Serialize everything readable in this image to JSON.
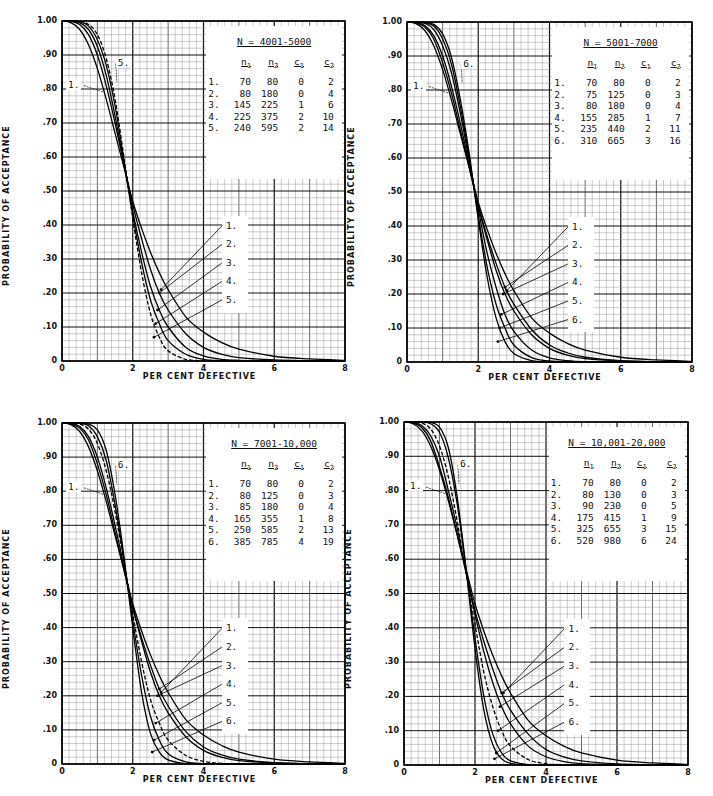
{
  "figure": {
    "xlabel": "PER CENT DEFECTIVE",
    "ylabel": "PROBABILITY OF ACCEPTANCE",
    "xticks": [
      "0",
      "2",
      "4",
      "6",
      "8"
    ],
    "yticks": [
      "1.00",
      ".90",
      ".80",
      ".70",
      ".60",
      ".50",
      ".40",
      ".30",
      ".20",
      ".10",
      "0"
    ]
  },
  "chart_data": [
    {
      "type": "line",
      "title": "N = 4001-5000",
      "xlabel": "PER CENT DEFECTIVE",
      "ylabel": "PROBABILITY OF ACCEPTANCE",
      "xlim": [
        0,
        8
      ],
      "ylim": [
        0,
        1.0
      ],
      "grid": true,
      "legend_position": "upper right (table)",
      "table_headers": [
        "n1",
        "n2",
        "c1",
        "c2"
      ],
      "plans": [
        {
          "id": "1.",
          "n1": "70",
          "n2": "80",
          "c1": "0",
          "c2": "2"
        },
        {
          "id": "2.",
          "n1": "80",
          "n2": "180",
          "c1": "0",
          "c2": "4"
        },
        {
          "id": "3.",
          "n1": "145",
          "n2": "225",
          "c1": "1",
          "c2": "6"
        },
        {
          "id": "4.",
          "n1": "225",
          "n2": "375",
          "c1": "2",
          "c2": "10"
        },
        {
          "id": "5.",
          "n1": "240",
          "n2": "595",
          "c1": "2",
          "c2": "14"
        }
      ],
      "x": [
        0,
        0.25,
        0.5,
        0.75,
        1.0,
        1.25,
        1.5,
        1.75,
        2.0,
        2.25,
        2.5,
        2.75,
        3.0,
        3.5,
        4.0,
        4.5,
        5.0,
        6.0,
        7.0,
        8.0
      ],
      "series": [
        {
          "name": "1.",
          "dashed": false,
          "values": [
            1.0,
            0.995,
            0.975,
            0.93,
            0.86,
            0.77,
            0.67,
            0.57,
            0.47,
            0.39,
            0.32,
            0.26,
            0.21,
            0.13,
            0.085,
            0.055,
            0.035,
            0.014,
            0.006,
            0.002
          ]
        },
        {
          "name": "2.",
          "dashed": false,
          "values": [
            1.0,
            0.999,
            0.99,
            0.96,
            0.9,
            0.81,
            0.7,
            0.58,
            0.46,
            0.36,
            0.27,
            0.2,
            0.15,
            0.08,
            0.04,
            0.02,
            0.01,
            0.003,
            0.001,
            0.0
          ]
        },
        {
          "name": "3.",
          "dashed": false,
          "values": [
            1.0,
            1.0,
            0.995,
            0.975,
            0.925,
            0.84,
            0.72,
            0.58,
            0.44,
            0.32,
            0.22,
            0.15,
            0.1,
            0.04,
            0.015,
            0.005,
            0.002,
            0.0,
            0.0,
            0.0
          ]
        },
        {
          "name": "4.",
          "dashed": false,
          "values": [
            1.0,
            1.0,
            0.998,
            0.985,
            0.945,
            0.87,
            0.75,
            0.59,
            0.43,
            0.29,
            0.18,
            0.11,
            0.06,
            0.02,
            0.005,
            0.001,
            0.0,
            0.0,
            0.0,
            0.0
          ]
        },
        {
          "name": "5.",
          "dashed": true,
          "values": [
            1.0,
            1.0,
            0.999,
            0.99,
            0.96,
            0.89,
            0.77,
            0.6,
            0.42,
            0.26,
            0.14,
            0.07,
            0.03,
            0.005,
            0.001,
            0.0,
            0.0,
            0.0,
            0.0,
            0.0
          ]
        }
      ],
      "curve_labels_top": [
        "1.",
        "5."
      ],
      "curve_labels_bottom": [
        "1.",
        "2.",
        "3.",
        "4.",
        "5."
      ]
    },
    {
      "type": "line",
      "title": "N = 5001-7000",
      "xlabel": "PER CENT DEFECTIVE",
      "ylabel": "PROBABILITY OF ACCEPTANCE",
      "xlim": [
        0,
        8
      ],
      "ylim": [
        0,
        1.0
      ],
      "grid": true,
      "legend_position": "upper right (table)",
      "table_headers": [
        "n1",
        "n2",
        "c1",
        "c2"
      ],
      "plans": [
        {
          "id": "1.",
          "n1": "70",
          "n2": "80",
          "c1": "0",
          "c2": "2"
        },
        {
          "id": "2.",
          "n1": "75",
          "n2": "125",
          "c1": "0",
          "c2": "3"
        },
        {
          "id": "3.",
          "n1": "80",
          "n2": "180",
          "c1": "0",
          "c2": "4"
        },
        {
          "id": "4.",
          "n1": "155",
          "n2": "285",
          "c1": "1",
          "c2": "7"
        },
        {
          "id": "5.",
          "n1": "235",
          "n2": "440",
          "c1": "2",
          "c2": "11"
        },
        {
          "id": "6.",
          "n1": "310",
          "n2": "665",
          "c1": "3",
          "c2": "16"
        }
      ],
      "x": [
        0,
        0.25,
        0.5,
        0.75,
        1.0,
        1.25,
        1.5,
        1.75,
        2.0,
        2.25,
        2.5,
        2.75,
        3.0,
        3.5,
        4.0,
        4.5,
        5.0,
        6.0,
        7.0,
        8.0
      ],
      "series": [
        {
          "name": "1.",
          "dashed": false,
          "values": [
            1.0,
            0.995,
            0.975,
            0.93,
            0.86,
            0.77,
            0.67,
            0.57,
            0.47,
            0.39,
            0.32,
            0.26,
            0.21,
            0.13,
            0.085,
            0.055,
            0.035,
            0.014,
            0.006,
            0.002
          ]
        },
        {
          "name": "2.",
          "dashed": false,
          "values": [
            1.0,
            0.997,
            0.985,
            0.95,
            0.88,
            0.79,
            0.68,
            0.57,
            0.46,
            0.37,
            0.29,
            0.22,
            0.17,
            0.095,
            0.05,
            0.027,
            0.014,
            0.004,
            0.001,
            0.0
          ]
        },
        {
          "name": "3.",
          "dashed": false,
          "values": [
            1.0,
            0.999,
            0.99,
            0.96,
            0.9,
            0.81,
            0.7,
            0.58,
            0.46,
            0.36,
            0.27,
            0.2,
            0.15,
            0.08,
            0.04,
            0.02,
            0.01,
            0.003,
            0.001,
            0.0
          ]
        },
        {
          "name": "4.",
          "dashed": false,
          "values": [
            1.0,
            1.0,
            0.996,
            0.978,
            0.93,
            0.85,
            0.73,
            0.59,
            0.45,
            0.32,
            0.22,
            0.14,
            0.09,
            0.035,
            0.012,
            0.004,
            0.001,
            0.0,
            0.0,
            0.0
          ]
        },
        {
          "name": "5.",
          "dashed": false,
          "values": [
            1.0,
            1.0,
            0.998,
            0.988,
            0.95,
            0.875,
            0.75,
            0.6,
            0.43,
            0.28,
            0.17,
            0.1,
            0.05,
            0.013,
            0.003,
            0.0,
            0.0,
            0.0,
            0.0,
            0.0
          ]
        },
        {
          "name": "6.",
          "dashed": false,
          "values": [
            1.0,
            1.0,
            0.999,
            0.993,
            0.965,
            0.895,
            0.77,
            0.61,
            0.42,
            0.25,
            0.13,
            0.06,
            0.025,
            0.004,
            0.0,
            0.0,
            0.0,
            0.0,
            0.0,
            0.0
          ]
        }
      ],
      "curve_labels_top": [
        "1.",
        "6."
      ],
      "curve_labels_bottom": [
        "1.",
        "2.",
        "3.",
        "4.",
        "5.",
        "6."
      ]
    },
    {
      "type": "line",
      "title": "N = 7001-10,000",
      "xlabel": "PER CENT DEFECTIVE",
      "ylabel": "PROBABILITY OF ACCEPTANCE",
      "xlim": [
        0,
        8
      ],
      "ylim": [
        0,
        1.0
      ],
      "grid": true,
      "legend_position": "upper right (table)",
      "table_headers": [
        "n1",
        "n2",
        "c1",
        "c2"
      ],
      "plans": [
        {
          "id": "1.",
          "n1": "70",
          "n2": "80",
          "c1": "0",
          "c2": "2"
        },
        {
          "id": "2.",
          "n1": "80",
          "n2": "125",
          "c1": "0",
          "c2": "3"
        },
        {
          "id": "3.",
          "n1": "85",
          "n2": "180",
          "c1": "0",
          "c2": "4"
        },
        {
          "id": "4.",
          "n1": "165",
          "n2": "355",
          "c1": "1",
          "c2": "8"
        },
        {
          "id": "5.",
          "n1": "250",
          "n2": "585",
          "c1": "2",
          "c2": "13"
        },
        {
          "id": "6.",
          "n1": "385",
          "n2": "785",
          "c1": "4",
          "c2": "19"
        }
      ],
      "x": [
        0,
        0.25,
        0.5,
        0.75,
        1.0,
        1.25,
        1.5,
        1.75,
        2.0,
        2.25,
        2.5,
        2.75,
        3.0,
        3.5,
        4.0,
        4.5,
        5.0,
        6.0,
        7.0,
        8.0
      ],
      "series": [
        {
          "name": "1.",
          "dashed": false,
          "values": [
            1.0,
            0.995,
            0.975,
            0.93,
            0.86,
            0.77,
            0.67,
            0.57,
            0.47,
            0.39,
            0.32,
            0.26,
            0.21,
            0.13,
            0.085,
            0.055,
            0.035,
            0.014,
            0.006,
            0.002
          ]
        },
        {
          "name": "2.",
          "dashed": false,
          "values": [
            1.0,
            0.997,
            0.985,
            0.95,
            0.88,
            0.79,
            0.68,
            0.57,
            0.46,
            0.37,
            0.29,
            0.22,
            0.17,
            0.095,
            0.05,
            0.027,
            0.014,
            0.004,
            0.001,
            0.0
          ]
        },
        {
          "name": "3.",
          "dashed": false,
          "values": [
            1.0,
            0.999,
            0.99,
            0.96,
            0.9,
            0.81,
            0.7,
            0.58,
            0.46,
            0.36,
            0.27,
            0.2,
            0.15,
            0.08,
            0.04,
            0.02,
            0.01,
            0.003,
            0.001,
            0.0
          ]
        },
        {
          "name": "4.",
          "dashed": true,
          "values": [
            1.0,
            1.0,
            0.997,
            0.982,
            0.94,
            0.86,
            0.74,
            0.59,
            0.44,
            0.3,
            0.19,
            0.12,
            0.07,
            0.025,
            0.008,
            0.002,
            0.0,
            0.0,
            0.0,
            0.0
          ]
        },
        {
          "name": "5.",
          "dashed": false,
          "values": [
            1.0,
            1.0,
            0.999,
            0.992,
            0.96,
            0.89,
            0.76,
            0.6,
            0.42,
            0.26,
            0.14,
            0.07,
            0.03,
            0.006,
            0.001,
            0.0,
            0.0,
            0.0,
            0.0,
            0.0
          ]
        },
        {
          "name": "6.",
          "dashed": false,
          "values": [
            1.0,
            1.0,
            1.0,
            0.997,
            0.98,
            0.92,
            0.79,
            0.61,
            0.4,
            0.21,
            0.09,
            0.035,
            0.012,
            0.001,
            0.0,
            0.0,
            0.0,
            0.0,
            0.0,
            0.0
          ]
        }
      ],
      "curve_labels_top": [
        "1.",
        "6."
      ],
      "curve_labels_bottom": [
        "1.",
        "2.",
        "3.",
        "4.",
        "5.",
        "6."
      ]
    },
    {
      "type": "line",
      "title": "N = 10,001-20,000",
      "xlabel": "PER CENT DEFECTIVE",
      "ylabel": "PROBABILITY OF ACCEPTANCE",
      "xlim": [
        0,
        8
      ],
      "ylim": [
        0,
        1.0
      ],
      "grid": true,
      "legend_position": "upper right (table)",
      "table_headers": [
        "n1",
        "n2",
        "c1",
        "c2"
      ],
      "plans": [
        {
          "id": "1.",
          "n1": "70",
          "n2": "80",
          "c1": "0",
          "c2": "2"
        },
        {
          "id": "2.",
          "n1": "80",
          "n2": "130",
          "c1": "0",
          "c2": "3"
        },
        {
          "id": "3.",
          "n1": "90",
          "n2": "230",
          "c1": "0",
          "c2": "5"
        },
        {
          "id": "4.",
          "n1": "175",
          "n2": "415",
          "c1": "1",
          "c2": "9"
        },
        {
          "id": "5.",
          "n1": "325",
          "n2": "655",
          "c1": "3",
          "c2": "15"
        },
        {
          "id": "6.",
          "n1": "520",
          "n2": "980",
          "c1": "6",
          "c2": "24"
        }
      ],
      "x": [
        0,
        0.25,
        0.5,
        0.75,
        1.0,
        1.25,
        1.5,
        1.75,
        2.0,
        2.25,
        2.5,
        2.75,
        3.0,
        3.5,
        4.0,
        4.5,
        5.0,
        6.0,
        7.0,
        8.0
      ],
      "series": [
        {
          "name": "1.",
          "dashed": false,
          "values": [
            1.0,
            0.995,
            0.975,
            0.93,
            0.86,
            0.77,
            0.67,
            0.57,
            0.47,
            0.39,
            0.32,
            0.26,
            0.21,
            0.13,
            0.085,
            0.055,
            0.035,
            0.014,
            0.006,
            0.002
          ]
        },
        {
          "name": "2.",
          "dashed": false,
          "values": [
            1.0,
            0.997,
            0.984,
            0.945,
            0.87,
            0.78,
            0.67,
            0.56,
            0.45,
            0.36,
            0.28,
            0.21,
            0.16,
            0.09,
            0.045,
            0.024,
            0.012,
            0.003,
            0.001,
            0.0
          ]
        },
        {
          "name": "3.",
          "dashed": false,
          "values": [
            1.0,
            0.999,
            0.99,
            0.96,
            0.9,
            0.8,
            0.69,
            0.56,
            0.44,
            0.33,
            0.24,
            0.17,
            0.12,
            0.055,
            0.024,
            0.01,
            0.004,
            0.001,
            0.0,
            0.0
          ]
        },
        {
          "name": "4.",
          "dashed": true,
          "values": [
            1.0,
            1.0,
            0.997,
            0.98,
            0.93,
            0.84,
            0.71,
            0.56,
            0.41,
            0.27,
            0.17,
            0.1,
            0.055,
            0.016,
            0.004,
            0.001,
            0.0,
            0.0,
            0.0,
            0.0
          ]
        },
        {
          "name": "5.",
          "dashed": false,
          "values": [
            1.0,
            1.0,
            1.0,
            0.995,
            0.97,
            0.895,
            0.76,
            0.57,
            0.37,
            0.2,
            0.09,
            0.035,
            0.012,
            0.001,
            0.0,
            0.0,
            0.0,
            0.0,
            0.0,
            0.0
          ]
        },
        {
          "name": "6.",
          "dashed": false,
          "values": [
            1.0,
            1.0,
            1.0,
            0.999,
            0.985,
            0.925,
            0.78,
            0.57,
            0.34,
            0.16,
            0.06,
            0.018,
            0.005,
            0.0,
            0.0,
            0.0,
            0.0,
            0.0,
            0.0,
            0.0
          ]
        }
      ],
      "curve_labels_top": [
        "1.",
        "6."
      ],
      "curve_labels_bottom": [
        "1.",
        "2.",
        "3.",
        "4.",
        "5.",
        "6."
      ]
    }
  ]
}
